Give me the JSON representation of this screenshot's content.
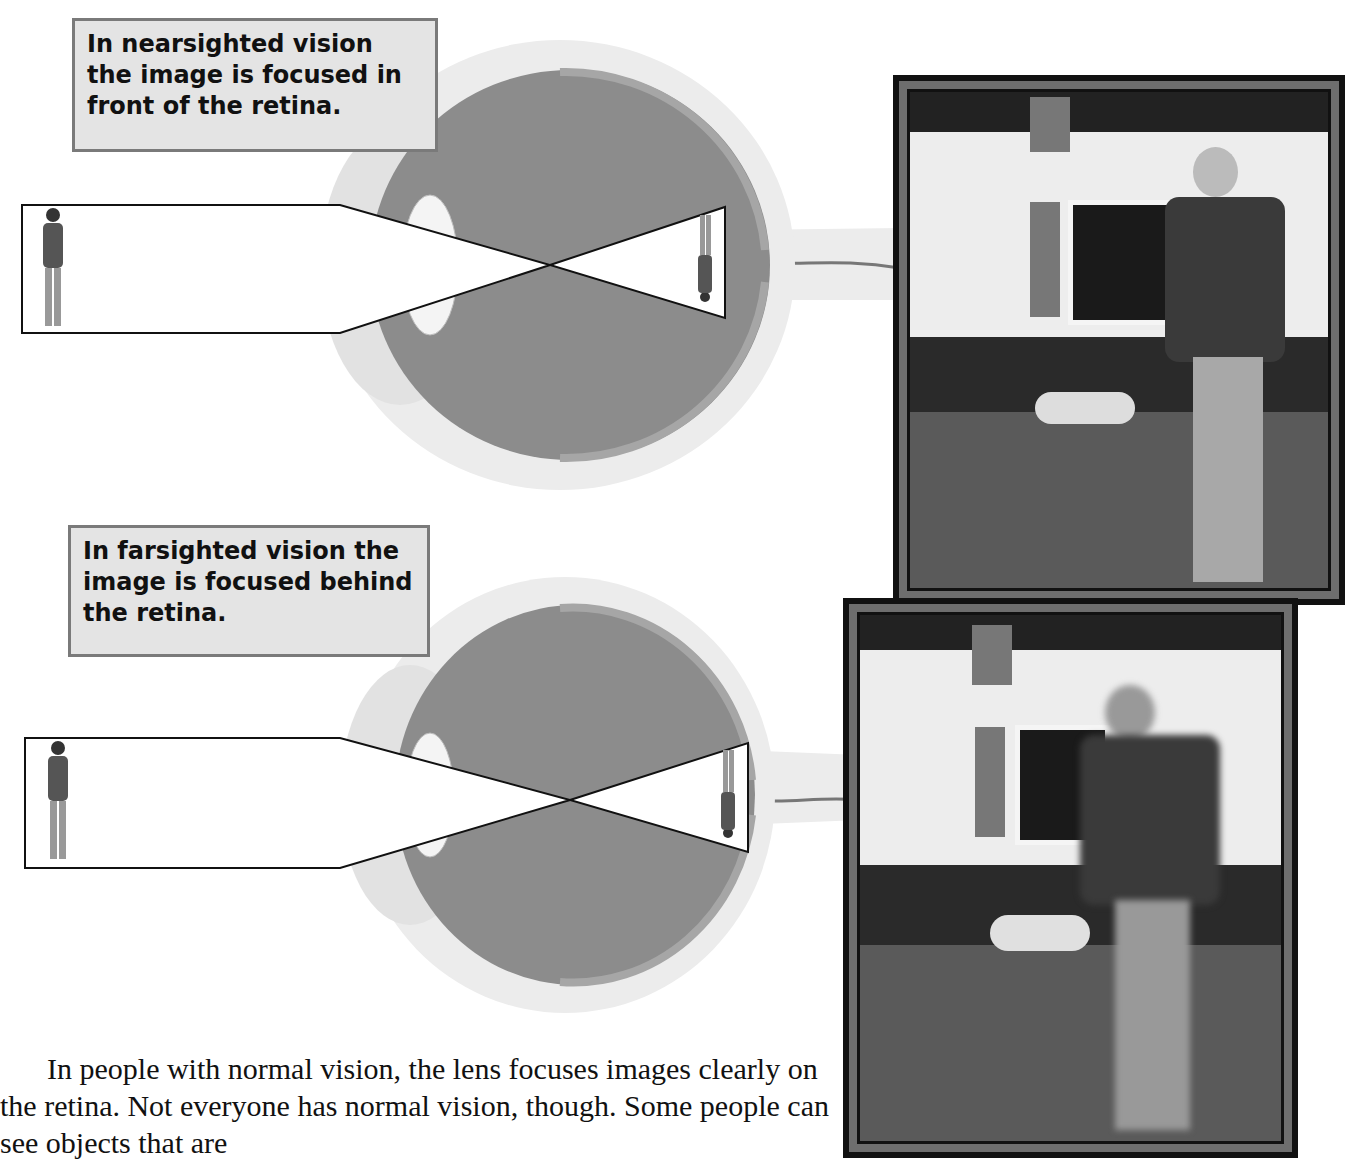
{
  "callouts": {
    "nearsighted": "In nearsighted vision the image is focused in front of the retina.",
    "farsighted": "In farsighted vision the image is focused behind the retina."
  },
  "diagrams": [
    {
      "name": "nearsighted-eye",
      "focus": "in front of retina"
    },
    {
      "name": "farsighted-eye",
      "focus": "behind retina"
    }
  ],
  "photos": [
    {
      "name": "nearsighted-view",
      "description": "Boy in focus near viewer, house and dog blurred in background"
    },
    {
      "name": "farsighted-view",
      "description": "Boy blurred in foreground, house and dog sharp in background"
    }
  ],
  "body": {
    "paragraph": "In people with normal vision, the lens focuses images clearly on the retina. Not everyone has normal vision, though. Some people can see objects that are"
  },
  "colors": {
    "callout_bg": "#e4e4e4",
    "callout_border": "#7a7a7a",
    "eye_fill": "#8a8a8a",
    "eye_outer": "#e9e9e9",
    "frame": "#6e6e6e"
  }
}
